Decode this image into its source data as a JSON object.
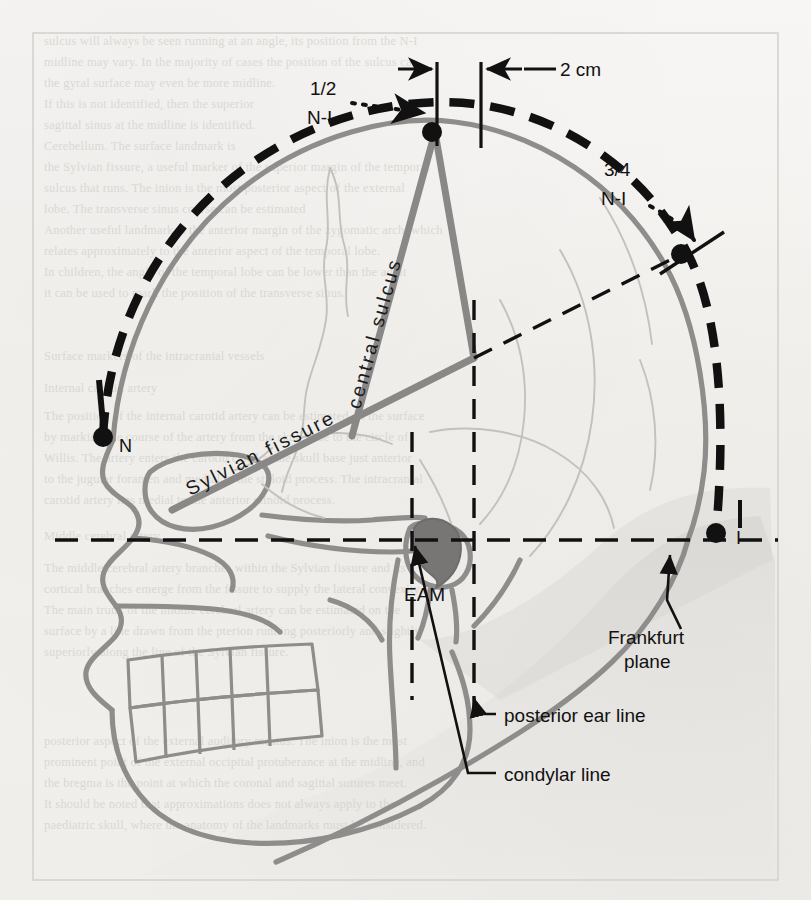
{
  "figure": {
    "type": "anatomical-diagram",
    "frame_color": "#d9d7d2",
    "background_color": "#f3f2ef"
  },
  "colors": {
    "skull_outline": "#8f8d8b",
    "sulcus_line": "#8a8886",
    "measure_line": "#111111",
    "dash_arc": "#111111",
    "eam_fill": "#787674",
    "ghost_text": "#c9c6c1"
  },
  "labels": {
    "half_ni_line1": "1/2",
    "half_ni_line2": "N-I",
    "three_quarter_ni_line1": "3/4",
    "three_quarter_ni_line2": "N-I",
    "two_cm": "2 cm",
    "central_sulcus": "central sulcus",
    "sylvian_fissure": "Sylvian fissure",
    "eam": "EAM",
    "frankfurt_plane_line1": "Frankfurt",
    "frankfurt_plane_line2": "plane",
    "posterior_ear_line": "posterior ear line",
    "condylar_line": "condylar line",
    "point_n": "N",
    "point_i": "I"
  },
  "landmarks": [
    {
      "name": "nasion",
      "symbol": "N",
      "x": 103,
      "y": 437
    },
    {
      "name": "inion",
      "symbol": "I",
      "x": 716,
      "y": 533
    },
    {
      "name": "half-n-i-point",
      "symbol": "1/2 N-I",
      "x": 432,
      "y": 132
    },
    {
      "name": "three-quarter-n-i-point",
      "symbol": "3/4 N-I",
      "x": 681,
      "y": 254
    }
  ],
  "reference_lines": [
    {
      "name": "frankfurt-plane",
      "style": "dashed-horizontal",
      "y": 540
    },
    {
      "name": "condylar-line",
      "style": "dashed-vertical",
      "x": 474
    },
    {
      "name": "posterior-ear-line",
      "style": "dashed-vertical",
      "x": 412
    },
    {
      "name": "n-i-arc",
      "style": "heavy-dashed-arc"
    },
    {
      "name": "two-cm-gap",
      "style": "solid-vertical-pair",
      "x1": 437,
      "x2": 481
    }
  ],
  "ghost_text": {
    "note": "faint show-through text from the reverse side of the printed page",
    "lines": [
      "sulcus will always be seen running at an angle, its position from the N-I",
      "midline may vary. In the majority of cases the position of the sulcus can",
      "the gyral surface may even be more midline.",
      "If this is not identified, then the superior",
      "sagittal sinus at the midline is identified.",
      "Cerebellum. The surface landmark is",
      "the Sylvian fissure, a useful marker of the superior margin of the temporal",
      "sulcus that runs. The inion is the most posterior aspect of the external",
      "lobe. The transverse sinus course can be estimated",
      "Another useful landmark is the anterior margin of the zygomatic arch, which",
      "relates approximately to the anterior aspect of the temporal lobe.",
      "In children, the angle of the temporal lobe can be lower than the adult",
      "it can be used to mark the position of the transverse sinus.",
      "Surface markers of the intracranial vessels",
      "Internal carotid artery",
      "The position of the internal carotid artery can be estimated on the surface",
      "by marking the course of the artery from the skull base to the circle of",
      "Willis. The artery enters the carotid canal at the skull base just anterior",
      "to the jugular foramen and medial to the styloid process. The intracranial",
      "carotid artery lies medial to the anterior clinoid process.",
      "Middle cerebral artery",
      "The middle cerebral artery branches within the Sylvian fissure and its",
      "cortical branches emerge from the fissure to supply the lateral convexity.",
      "The main trunk of the middle cerebral artery can be estimated on the",
      "surface by a line drawn from the pterion running posteriorly and slightly",
      "superiorly along the line of the Sylvian fissure.",
      "posterior aspect of the external auditory meatus. The inion is the most",
      "prominent point of the external occipital protuberance at the midline, and",
      "the bregma is the point at which the coronal and sagittal sutures meet.",
      "It should be noted that approximations does not always apply to the",
      "paediatric skull, where the anatomy of the landmarks must be considered.",
      "The position of a burr hole placed at the pterion."
    ]
  }
}
